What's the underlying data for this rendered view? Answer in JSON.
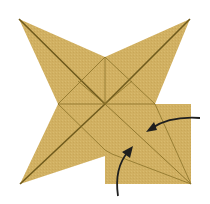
{
  "diagram": {
    "type": "origami-fold-step",
    "colors": {
      "paper": "#d1b062",
      "paper_dark": "#c4a352",
      "crease": "#8a7228",
      "valley_crease": "#6f5a1c",
      "arrow": "#1e1e1e",
      "background": "#ffffff"
    },
    "points": {
      "top_left_tip": [
        19,
        19
      ],
      "top_right_tip": [
        190,
        19
      ],
      "bottom_left_tip": [
        20,
        184
      ],
      "square_bottom_right": [
        191,
        184
      ],
      "center": [
        105,
        104
      ],
      "top_notch": [
        105,
        57
      ],
      "left_notch": [
        58,
        104
      ],
      "right_notch": [
        155,
        104
      ],
      "bottom_notch": [
        105,
        156
      ]
    },
    "arrows": [
      {
        "name": "right-flap-arrow",
        "from": [
          200,
          118
        ],
        "to": [
          148,
          130
        ]
      },
      {
        "name": "bottom-flap-arrow",
        "from": [
          118,
          196
        ],
        "to": [
          130,
          146
        ]
      }
    ]
  }
}
